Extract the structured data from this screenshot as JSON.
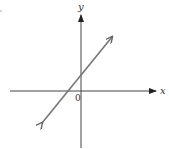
{
  "diagram": {
    "type": "coordinate-plane-line",
    "x_axis_label": "x",
    "y_axis_label": "y",
    "origin_label": "0",
    "colors": {
      "axes": "#444444",
      "line": "#777777",
      "text": "#333333"
    },
    "line": {
      "description": "straight line with positive slope, arrows at both ends, positive y-intercept, negative x-intercept",
      "end_upper_right": [
        113,
        36
      ],
      "end_lower_left": [
        41,
        124
      ],
      "x_intercept_px": 67,
      "y_intercept_px": 76
    }
  }
}
